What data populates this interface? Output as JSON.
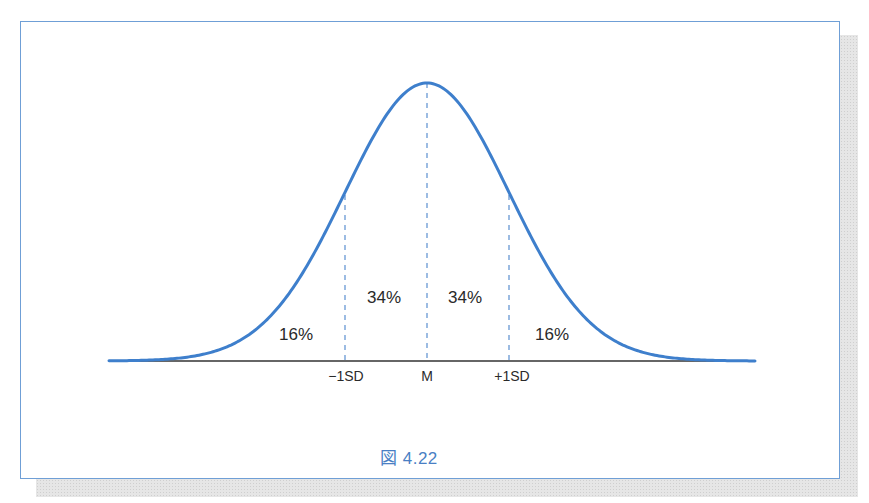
{
  "figure": {
    "caption": "図 4.22",
    "frame_color": "#6f9fd6",
    "curve_color": "#3e7fcc",
    "caption_color": "#4a7fc4"
  },
  "chart_data": {
    "type": "line",
    "title": "",
    "subtitle": "Normal distribution (bell curve)",
    "xlabel": "",
    "ylabel": "",
    "x_ticks": [
      "−1SD",
      "M",
      "+1SD"
    ],
    "x": [
      -3.5,
      -3,
      -2.5,
      -2,
      -1.5,
      -1,
      -0.5,
      0,
      0.5,
      1,
      1.5,
      2,
      2.5,
      3,
      3.5
    ],
    "series": [
      {
        "name": "normal density",
        "values": [
          0.001,
          0.004,
          0.018,
          0.054,
          0.13,
          0.242,
          0.352,
          0.399,
          0.352,
          0.242,
          0.13,
          0.054,
          0.018,
          0.004,
          0.001
        ]
      }
    ],
    "reference_lines": [
      {
        "label": "−1SD",
        "x": -1,
        "style": "dashed"
      },
      {
        "label": "M",
        "x": 0,
        "style": "dashed"
      },
      {
        "label": "+1SD",
        "x": 1,
        "style": "dashed"
      }
    ],
    "annotations": [
      {
        "text": "16%",
        "region": "below −1SD"
      },
      {
        "text": "34%",
        "region": "−1SD to M"
      },
      {
        "text": "34%",
        "region": "M to +1SD"
      },
      {
        "text": "16%",
        "region": "above +1SD"
      }
    ],
    "grid": false,
    "legend": "none"
  },
  "labels": {
    "pct_left_tail": "16%",
    "pct_left_center": "34%",
    "pct_right_center": "34%",
    "pct_right_tail": "16%",
    "tick_minus": "−1SD",
    "tick_mean": "M",
    "tick_plus": "+1SD"
  }
}
